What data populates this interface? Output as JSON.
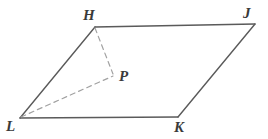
{
  "figure": {
    "kind": "geometry-diagram",
    "canvas": {
      "width": 268,
      "height": 139,
      "background": "#ffffff"
    },
    "style": {
      "solid_stroke": "#5a5a5a",
      "dashed_stroke": "#a2a2a2",
      "solid_width": 1.4,
      "dashed_width": 1.2,
      "dash_pattern": "5 4",
      "label_color": "#3a3a3a"
    },
    "points": [
      {
        "id": "H",
        "label": "H",
        "x": 95,
        "y": 27,
        "label_x": 83,
        "label_y": 8
      },
      {
        "id": "J",
        "label": "J",
        "x": 255,
        "y": 24,
        "label_x": 243,
        "label_y": 6
      },
      {
        "id": "K",
        "label": "K",
        "x": 178,
        "y": 117,
        "label_x": 174,
        "label_y": 120
      },
      {
        "id": "L",
        "label": "L",
        "x": 20,
        "y": 118,
        "label_x": 6,
        "label_y": 119
      },
      {
        "id": "P",
        "label": "P",
        "x": 113,
        "y": 75,
        "label_x": 119,
        "label_y": 69
      }
    ],
    "solid_edges": [
      {
        "name": "edge-HJ",
        "from": "H",
        "to": "J",
        "x1": 95,
        "y1": 27,
        "x2": 255,
        "y2": 24
      },
      {
        "name": "edge-JK",
        "from": "J",
        "to": "K",
        "x1": 255,
        "y1": 24,
        "x2": 178,
        "y2": 117
      },
      {
        "name": "edge-KL",
        "from": "K",
        "to": "L",
        "x1": 178,
        "y1": 117,
        "x2": 20,
        "y2": 118
      },
      {
        "name": "edge-LH",
        "from": "L",
        "to": "H",
        "x1": 20,
        "y1": 118,
        "x2": 95,
        "y2": 27
      }
    ],
    "dashed_edges": [
      {
        "name": "segment-HP",
        "from": "H",
        "to": "P",
        "x1": 95,
        "y1": 28,
        "x2": 113,
        "y2": 74
      },
      {
        "name": "segment-LP",
        "from": "L",
        "to": "P",
        "x1": 21,
        "y1": 117,
        "x2": 113,
        "y2": 76
      }
    ]
  }
}
